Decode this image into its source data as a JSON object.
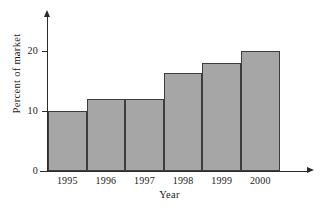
{
  "chart_data": {
    "type": "bar",
    "title": "",
    "xlabel": "Year",
    "ylabel": "Percent of market",
    "categories": [
      "1995",
      "1996",
      "1997",
      "1998",
      "1999",
      "2000"
    ],
    "values": [
      10,
      12,
      12,
      16.3,
      18,
      20
    ],
    "ylim": [
      0,
      26
    ],
    "y_ticks": [
      0,
      10,
      20
    ],
    "y_tick_labels": [
      "0",
      "10",
      "20"
    ],
    "xlim_categories": 6,
    "grid": false,
    "legend": null,
    "bar_fill_color": "#a6a6a6",
    "bar_edge_color": "#3d3d3d",
    "axis_color": "#2b2b2b",
    "bars_adjacent": true
  },
  "axes": {
    "y_title": "Percent of market",
    "x_title": "Year"
  }
}
